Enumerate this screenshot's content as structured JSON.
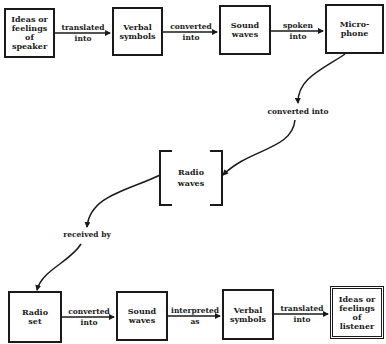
{
  "diagram": {
    "type": "communication-process-flow",
    "nodes": [
      {
        "id": "speaker_ideas",
        "label": "Ideas or\nfeelings\nof\nspeaker"
      },
      {
        "id": "verbal_symbols_1",
        "label": "Verbal\nsymbols"
      },
      {
        "id": "sound_waves_1",
        "label": "Sound\nwaves"
      },
      {
        "id": "microphone",
        "label": "Micro-\nphone"
      },
      {
        "id": "radio_waves",
        "label": "Radio\nwaves"
      },
      {
        "id": "radio_set",
        "label": "Radio\nset"
      },
      {
        "id": "sound_waves_2",
        "label": "Sound\nwaves"
      },
      {
        "id": "verbal_symbols_2",
        "label": "Verbal\nsymbols"
      },
      {
        "id": "listener_ideas",
        "label": "Ideas or\nfeelings\nof\nlistener"
      }
    ],
    "edges": [
      {
        "from": "speaker_ideas",
        "to": "verbal_symbols_1",
        "label": "translated\ninto"
      },
      {
        "from": "verbal_symbols_1",
        "to": "sound_waves_1",
        "label": "converted\ninto"
      },
      {
        "from": "sound_waves_1",
        "to": "microphone",
        "label": "spoken\ninto"
      },
      {
        "from": "microphone",
        "to": "radio_waves",
        "label": "converted into"
      },
      {
        "from": "radio_waves",
        "to": "radio_set",
        "label": "received by"
      },
      {
        "from": "radio_set",
        "to": "sound_waves_2",
        "label": "converted\ninto"
      },
      {
        "from": "sound_waves_2",
        "to": "verbal_symbols_2",
        "label": "interpreted\nas"
      },
      {
        "from": "verbal_symbols_2",
        "to": "listener_ideas",
        "label": "translated\ninto"
      }
    ]
  }
}
